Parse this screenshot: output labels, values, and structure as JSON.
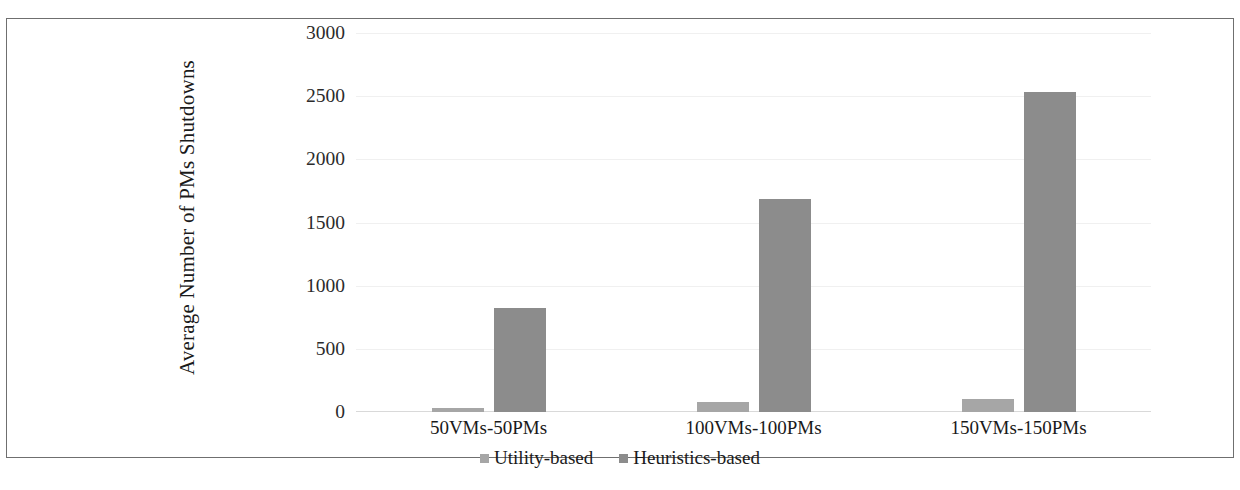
{
  "chart_data": {
    "type": "bar",
    "title": "",
    "xlabel": "",
    "ylabel": "Average Number of PMs Shutdowns",
    "ylim": [
      0,
      3000
    ],
    "yticks": [
      0,
      500,
      1000,
      1500,
      2000,
      2500,
      3000
    ],
    "ytick_labels": [
      "0",
      "500",
      "1000",
      "1500",
      "2000",
      "2500",
      "3000"
    ],
    "categories": [
      "50VMs-50PMs",
      "100VMs-100PMs",
      "150VMs-150PMs"
    ],
    "series": [
      {
        "name": "Utility-based",
        "color": "#a6a6a6",
        "values": [
          30,
          80,
          105
        ]
      },
      {
        "name": "Heuristics-based",
        "color": "#8c8c8c",
        "values": [
          820,
          1690,
          2530
        ]
      }
    ],
    "grid": true,
    "legend_position": "bottom"
  },
  "axis": {
    "y_title": "Average Number of PMs Shutdowns"
  },
  "legend": {
    "items": [
      {
        "label": "Utility-based"
      },
      {
        "label": "Heuristics-based"
      }
    ]
  },
  "caption": {
    "text": ""
  }
}
